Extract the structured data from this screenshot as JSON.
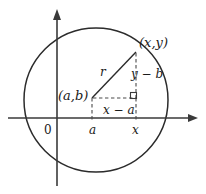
{
  "figure": {
    "colors": {
      "background": "#ffffff",
      "axis": "#3a3a3a",
      "circle": "#2b2b2b",
      "radius": "#2b2b2b",
      "dashed": "#4a4a4a",
      "text": "#1a1a1a"
    },
    "labels": {
      "point_on_circle": "(x,y)",
      "center_point": "(a,b)",
      "radius": "r",
      "vertical_leg": "y − b",
      "horizontal_leg": "x − a",
      "tick_origin": "0",
      "tick_a": "a",
      "tick_x": "x"
    },
    "geometry": {
      "circle_center": [
        96,
        100
      ],
      "circle_radius": 72,
      "center_marker": [
        92,
        98
      ],
      "point_on_circle": [
        136,
        52
      ],
      "x_axis_y": 118,
      "y_axis_x": 57,
      "right_angle_vertex": [
        136,
        98
      ]
    }
  }
}
